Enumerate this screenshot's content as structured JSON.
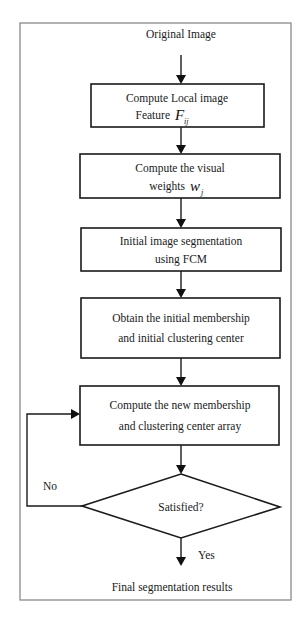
{
  "diagram": {
    "type": "flowchart",
    "start": {
      "label": "Original Image"
    },
    "steps": [
      {
        "id": "step1",
        "line1": "Compute Local image",
        "line2": "Feature",
        "symbol": "F",
        "subscript": "ij"
      },
      {
        "id": "step2",
        "line1": "Compute the visual",
        "line2": "weights",
        "symbol": "w",
        "subscript": "j"
      },
      {
        "id": "step3",
        "line1": "Initial image segmentation",
        "line2": "using FCM"
      },
      {
        "id": "step4",
        "line1": "Obtain the initial membership",
        "line2": "and initial clustering center"
      },
      {
        "id": "step5",
        "line1": "Compute the new membership",
        "line2": "and clustering center array"
      }
    ],
    "decision": {
      "label": "Satisfied?",
      "no_label": "No",
      "yes_label": "Yes"
    },
    "end": {
      "label": "Final segmentation results"
    },
    "edges": [
      {
        "from": "start",
        "to": "step1"
      },
      {
        "from": "step1",
        "to": "step2"
      },
      {
        "from": "step2",
        "to": "step3"
      },
      {
        "from": "step3",
        "to": "step4"
      },
      {
        "from": "step4",
        "to": "step5"
      },
      {
        "from": "step5",
        "to": "decision"
      },
      {
        "from": "decision",
        "to": "step5",
        "label": "No"
      },
      {
        "from": "decision",
        "to": "end",
        "label": "Yes"
      }
    ]
  }
}
